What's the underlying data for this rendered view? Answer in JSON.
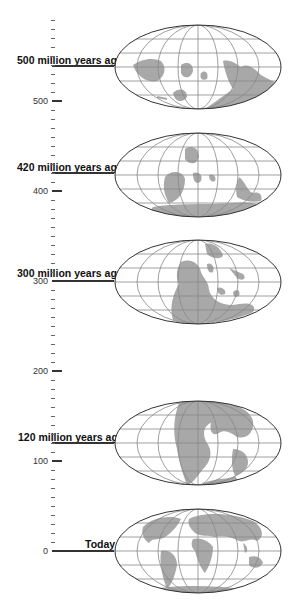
{
  "axis": {
    "unit": "million years ago",
    "major_ticks": [
      {
        "value": 500,
        "label": "500",
        "y": 101
      },
      {
        "value": 400,
        "label": "400",
        "y": 191
      },
      {
        "value": 300,
        "label": "300",
        "y": 281
      },
      {
        "value": 200,
        "label": "200",
        "y": 371
      },
      {
        "value": 100,
        "label": "100",
        "y": 461
      },
      {
        "value": 0,
        "label": "0",
        "y": 551
      }
    ]
  },
  "eras": [
    {
      "label": "500 million years ago",
      "value": 500,
      "globe_center_y": 66,
      "line_y": 66
    },
    {
      "label": "420 million years ago",
      "value": 420,
      "globe_center_y": 173,
      "line_y": 173
    },
    {
      "label": "300 million years ago",
      "value": 300,
      "globe_center_y": 281,
      "line_y": 281
    },
    {
      "label": "120 million years ago",
      "value": 120,
      "globe_center_y": 443,
      "line_y": 443
    },
    {
      "label": "Today",
      "value": 0,
      "globe_center_y": 551,
      "line_y": 551
    }
  ],
  "colors": {
    "land": "#a8a8a8",
    "grid": "#888888",
    "outline": "#333333",
    "axis": "#333333"
  }
}
